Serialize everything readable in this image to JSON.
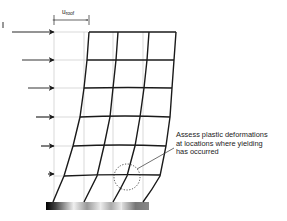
{
  "diagram": {
    "title_fragment": "...",
    "displacement_label": {
      "symbol": "u",
      "subscript": "roof"
    },
    "annotation": {
      "lines": [
        "Assess plastic deformations",
        "at locations where yielding",
        "has occurred"
      ]
    },
    "frame": {
      "stories": 5,
      "bays": 3,
      "floor_levels_y": [
        32,
        60,
        88,
        117,
        146,
        176
      ],
      "undeformed_columns_x": [
        54,
        84,
        113,
        143
      ],
      "lateral_loads": [
        {
          "y": 32,
          "x_start": 12
        },
        {
          "y": 60,
          "x_start": 22
        },
        {
          "y": 88,
          "x_start": 28
        },
        {
          "y": 117,
          "x_start": 36
        },
        {
          "y": 146,
          "x_start": 41
        },
        {
          "y": 174,
          "x_start": 47
        }
      ]
    },
    "colors": {
      "frame": "#1a1a1a",
      "grid": "#c8c8c8",
      "arrows": "#2a2a2a",
      "ground_dark": "#000000",
      "ground_light": "#e0e0e0"
    }
  }
}
